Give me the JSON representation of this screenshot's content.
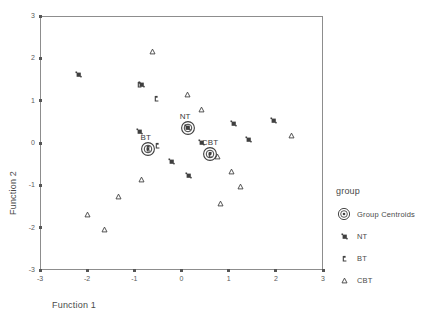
{
  "chart_data": {
    "type": "scatter",
    "title": "",
    "xlabel": "Function 1",
    "ylabel": "Function 2",
    "xlim": [
      -3,
      3
    ],
    "ylim": [
      -3,
      3
    ],
    "xticks": [
      "-3",
      "-2",
      "-1",
      "0",
      "1",
      "2",
      "3"
    ],
    "yticks": [
      "-3",
      "-2",
      "-1",
      "0",
      "1",
      "2",
      "3"
    ],
    "xtick_values": [
      -3,
      -2,
      -1,
      0,
      1,
      2,
      3
    ],
    "ytick_values": [
      -3,
      -2,
      -1,
      0,
      1,
      2,
      3
    ],
    "grid": false,
    "legend_position": "right",
    "legend_title": "group",
    "series": [
      {
        "name": "NT",
        "marker": "square",
        "points": [
          {
            "x": -2.18,
            "y": 1.62
          },
          {
            "x": -0.85,
            "y": 1.38
          },
          {
            "x": -0.88,
            "y": 0.27
          },
          {
            "x": 0.43,
            "y": 0.02
          },
          {
            "x": 0.15,
            "y": -0.76
          },
          {
            "x": -0.22,
            "y": -0.43
          },
          {
            "x": 1.11,
            "y": 0.45
          },
          {
            "x": 1.41,
            "y": 0.09
          },
          {
            "x": 1.96,
            "y": 0.53
          },
          {
            "x": 0.12,
            "y": 0.36
          }
        ]
      },
      {
        "name": "BT",
        "marker": "flag",
        "points": [
          {
            "x": -0.53,
            "y": 1.06
          },
          {
            "x": -0.5,
            "y": -0.06
          },
          {
            "x": -0.7,
            "y": -0.13
          },
          {
            "x": -0.88,
            "y": 1.38
          },
          {
            "x": 0.62,
            "y": -0.26
          }
        ]
      },
      {
        "name": "CBT",
        "marker": "triangle",
        "points": [
          {
            "x": -0.62,
            "y": 2.15
          },
          {
            "x": 0.13,
            "y": 1.14
          },
          {
            "x": 0.43,
            "y": 0.78
          },
          {
            "x": 2.33,
            "y": 0.17
          },
          {
            "x": 0.77,
            "y": -0.31
          },
          {
            "x": 1.05,
            "y": -0.67
          },
          {
            "x": 1.25,
            "y": -1.02
          },
          {
            "x": 0.83,
            "y": -1.42
          },
          {
            "x": -0.85,
            "y": -0.86
          },
          {
            "x": -1.33,
            "y": -1.27
          },
          {
            "x": -1.63,
            "y": -2.04
          },
          {
            "x": -1.99,
            "y": -1.7
          }
        ]
      }
    ],
    "centroids": [
      {
        "label": "NT",
        "x": 0.13,
        "y": 0.35
      },
      {
        "label": "BT",
        "x": -0.7,
        "y": -0.14
      },
      {
        "label": "CBT",
        "x": 0.6,
        "y": -0.25
      }
    ]
  },
  "axes": {
    "x_title": "Function 1",
    "y_title": "Function 2"
  },
  "legend": {
    "title": "group",
    "items": [
      {
        "label": "Group Centroids",
        "marker": "centroid-icon"
      },
      {
        "label": "NT",
        "marker": "square-icon"
      },
      {
        "label": "BT",
        "marker": "flag-icon"
      },
      {
        "label": "CBT",
        "marker": "triangle-icon"
      }
    ]
  },
  "colors": {
    "frame": "#8d8d8d",
    "marker": "#3f3f3f",
    "text": "#4a4a4a"
  }
}
